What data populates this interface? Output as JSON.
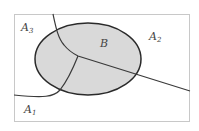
{
  "diagram": {
    "title": "",
    "universe": "sample space partitioned into A1, A2, A3",
    "event_set": {
      "label": "B",
      "fill": "#d9d9d9",
      "stroke": "#2a2a2a"
    },
    "regions": [
      {
        "id": "A1",
        "base": "A",
        "sub": "1"
      },
      {
        "id": "A2",
        "base": "A",
        "sub": "2"
      },
      {
        "id": "A3",
        "base": "A",
        "sub": "3"
      }
    ],
    "colors": {
      "border": "#c8c8c8",
      "lines": "#3a3a3a",
      "text": "#444444"
    }
  }
}
